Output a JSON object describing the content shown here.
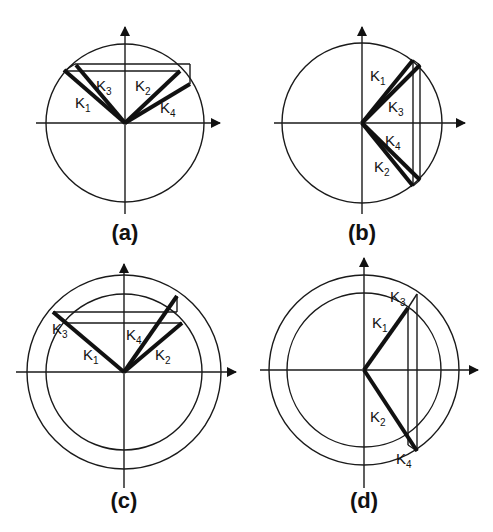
{
  "figure": {
    "colors": {
      "ink": "#111111",
      "background": "#ffffff"
    },
    "panels": [
      {
        "id": "a",
        "caption": "(a)",
        "labels": {
          "k1": "K",
          "k1_sub": "1",
          "k2": "K",
          "k2_sub": "2",
          "k3": "K",
          "k3_sub": "3",
          "k4": "K",
          "k4_sub": "4"
        },
        "circles": [
          "single"
        ]
      },
      {
        "id": "b",
        "caption": "(b)",
        "labels": {
          "k1": "K",
          "k1_sub": "1",
          "k2": "K",
          "k2_sub": "2",
          "k3": "K",
          "k3_sub": "3",
          "k4": "K",
          "k4_sub": "4"
        },
        "circles": [
          "single"
        ]
      },
      {
        "id": "c",
        "caption": "(c)",
        "labels": {
          "k1": "K",
          "k1_sub": "1",
          "k2": "K",
          "k2_sub": "2",
          "k3": "K",
          "k3_sub": "3",
          "k4": "K",
          "k4_sub": "4"
        },
        "circles": [
          "inner",
          "outer"
        ]
      },
      {
        "id": "d",
        "caption": "(d)",
        "labels": {
          "k1": "K",
          "k1_sub": "1",
          "k2": "K",
          "k2_sub": "2",
          "k3": "K",
          "k3_sub": "3",
          "k4": "K",
          "k4_sub": "4"
        },
        "circles": [
          "inner",
          "outer"
        ]
      }
    ]
  }
}
